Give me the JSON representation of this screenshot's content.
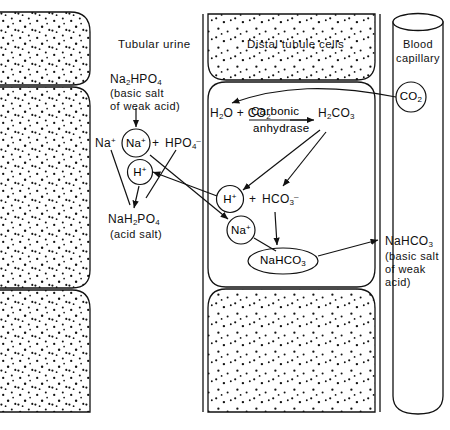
{
  "figure": {
    "background_color": "#ffffff",
    "line_color": "#111111"
  },
  "compartments": [
    {
      "id": "tubular-urine",
      "label": "Tubular urine",
      "kind": "lumen"
    },
    {
      "id": "distal-tubule-cells",
      "label": "Distal tubule cells",
      "kind": "epithelium"
    },
    {
      "id": "blood-capillary",
      "label": "Blood capillary",
      "kind": "vessel"
    }
  ],
  "tubular_urine": {
    "heading": "Tubular urine",
    "substrate": {
      "formula_html": "Na<sub>2</sub>HPO<sub>4</sub>",
      "note_line_1": "(basic salt",
      "note_line_2": "of weak acid)"
    },
    "dissociation": {
      "free_sodium_html": "Na<sup>+</sup>",
      "circled_sodium_html": "Na<sup>+</sup>",
      "plus": "+",
      "phosphate_html": "HPO<sub>4</sub><sup>–</sup>"
    },
    "circled_proton_html": "H<sup>+</sup>",
    "product": {
      "formula_html": "NaH<sub>2</sub>PO<sub>4</sub>",
      "note": "(acid salt)"
    }
  },
  "distal_tubule_cells": {
    "heading": "Distal tubule cells",
    "reaction": {
      "left_html": "H<sub>2</sub>O + CO<sub>2</sub>",
      "enzyme_top": "Carbonic",
      "enzyme_bottom": "anhydrase",
      "right_html": "H<sub>2</sub>CO<sub>3</sub>"
    },
    "dissociation": {
      "circled_proton_html": "H<sup>+</sup>",
      "plus": "+",
      "bicarbonate_html": "HCO<sub>3</sub><sup>–</sup>"
    },
    "circled_sodium_html": "Na<sup>+</sup>",
    "product_html": "NaHCO<sub>3</sub>"
  },
  "blood_capillary": {
    "heading_line_1": "Blood",
    "heading_line_2": "capillary",
    "circled_co2_html": "CO<sub>2</sub>",
    "output": {
      "formula_html": "NaHCO<sub>3</sub>",
      "note_line_1": "(basic salt",
      "note_line_2": "of weak",
      "note_line_3": "acid)"
    }
  },
  "arrows": [
    {
      "name": "na2hpo4-dissociates",
      "from": "Na2HPO4",
      "to": "Na+ + HPO4-"
    },
    {
      "name": "h-plus-to-phosphate",
      "from": "H+ (urine)",
      "to": "NaH2PO4"
    },
    {
      "name": "na-plus-to-product",
      "from": "Na+ (urine)",
      "to": "NaH2PO4"
    },
    {
      "name": "co2-into-cell",
      "from": "CO2 (capillary)",
      "to": "H2O + CO2 (cell)"
    },
    {
      "name": "h2co3-to-proton",
      "from": "H2CO3",
      "to": "H+ (cell)"
    },
    {
      "name": "h2co3-to-bicarbonate",
      "from": "H2CO3",
      "to": "HCO3-"
    },
    {
      "name": "proton-secretion",
      "from": "H+ (cell)",
      "to": "H+ (urine)"
    },
    {
      "name": "sodium-reabsorption",
      "from": "Na+ (urine)",
      "to": "Na+ (cell)"
    },
    {
      "name": "sodium-to-bicarbonate",
      "from": "Na+ (cell)",
      "to": "NaHCO3 (cell)"
    },
    {
      "name": "bicarbonate-to-product",
      "from": "HCO3-",
      "to": "NaHCO3 (cell)"
    },
    {
      "name": "nahco3-to-blood",
      "from": "NaHCO3 (cell)",
      "to": "NaHCO3 (blood)"
    }
  ]
}
